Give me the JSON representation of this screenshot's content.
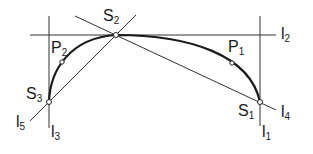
{
  "diagram": {
    "line_color": "#333333",
    "curve_color": "#1a1a1a",
    "points": [
      {
        "id": "S1",
        "main": "S",
        "sub": "1",
        "x": 260,
        "y": 102
      },
      {
        "id": "S2",
        "main": "S",
        "sub": "2",
        "x": 116,
        "y": 35
      },
      {
        "id": "S3",
        "main": "S",
        "sub": "3",
        "x": 49,
        "y": 102
      },
      {
        "id": "P1",
        "main": "P",
        "sub": "1",
        "x": 232,
        "y": 63
      },
      {
        "id": "P2",
        "main": "P",
        "sub": "2",
        "x": 62,
        "y": 62
      }
    ],
    "lines": [
      {
        "id": "l1",
        "main": "l",
        "sub": "1"
      },
      {
        "id": "l2",
        "main": "l",
        "sub": "2"
      },
      {
        "id": "l3",
        "main": "l",
        "sub": "3"
      },
      {
        "id": "l4",
        "main": "l",
        "sub": "4"
      },
      {
        "id": "l5",
        "main": "l",
        "sub": "5"
      }
    ]
  }
}
